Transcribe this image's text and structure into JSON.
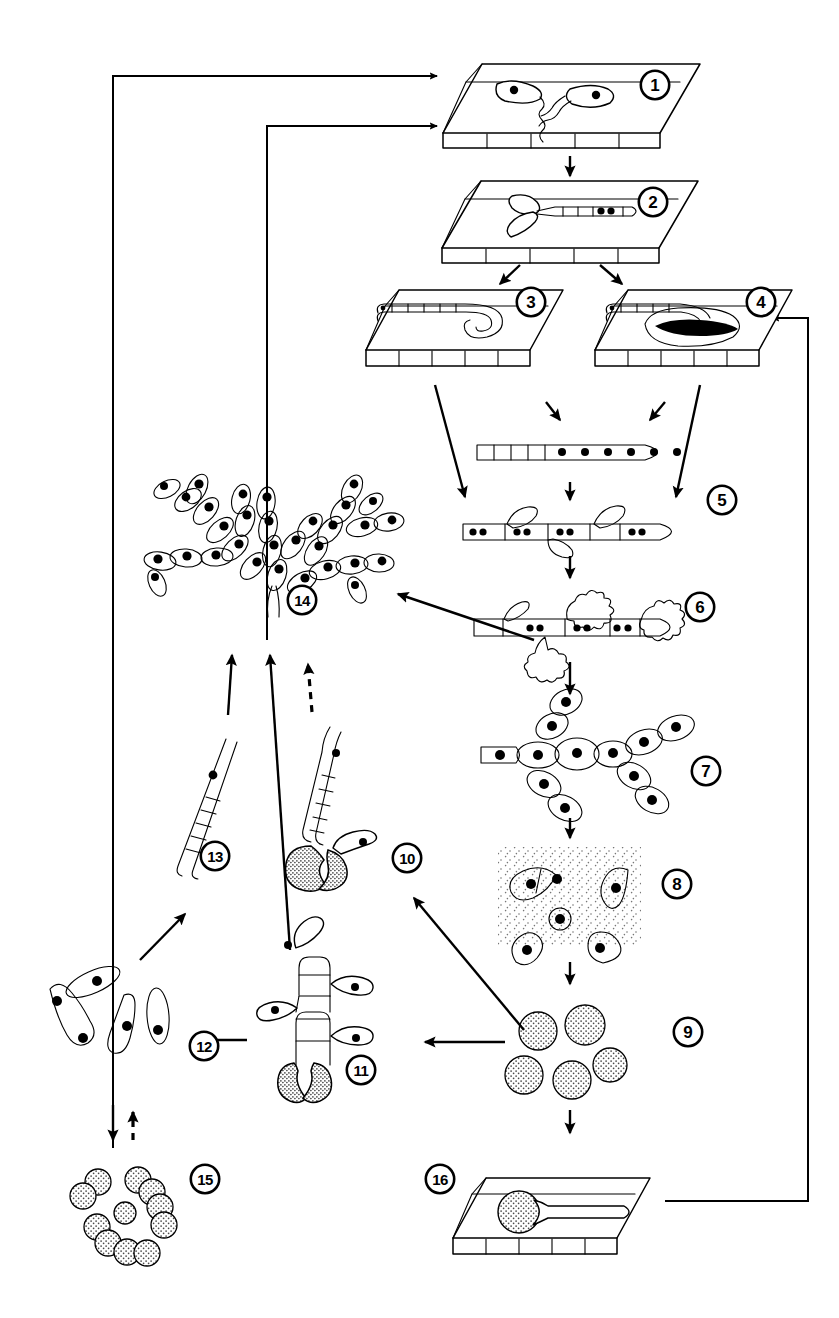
{
  "figure": {
    "background_color": "#ffffff",
    "line_color": "#000000",
    "nucleus_color": "#000000",
    "stipple_color": "#555555",
    "width": 839,
    "height": 1318
  },
  "stages": [
    {
      "id": 1,
      "label": "1",
      "name": "spores-germinating-on-leaf",
      "caption": "Two elongate spores with germ tubes on the host leaf surface",
      "number_x": 655,
      "number_y": 85
    },
    {
      "id": 2,
      "label": "2",
      "name": "appressorium-on-leaf",
      "caption": "Germ tube forming a forked appressorium on the leaf surface, two nuclei in the spore",
      "number_x": 653,
      "number_y": 202
    },
    {
      "id": 3,
      "label": "3",
      "name": "monokaryotic-penetration-hypha",
      "caption": "Penetration hypha growing inside the host tissue, no lesion",
      "number_x": 531,
      "number_y": 302
    },
    {
      "id": 4,
      "label": "4",
      "name": "penetration-hypha-with-lesion",
      "caption": "Penetration hypha inside host tissue with a dark necrotic lesion",
      "number_x": 761,
      "number_y": 302
    },
    {
      "id": 5,
      "label": "5",
      "name": "multinucleate-hypha",
      "caption": "Septate, multinucleate hypha and dikaryotic hypha with lateral branches",
      "number_x": 722,
      "number_y": 500
    },
    {
      "id": 6,
      "label": "6",
      "name": "haustoria-forming-hypha",
      "caption": "Dikaryotic hypha bearing lobed haustoria",
      "number_x": 700,
      "number_y": 607
    },
    {
      "id": 7,
      "label": "7",
      "name": "sporogenous-cell-chains",
      "caption": "Branched chains of swollen sporogenous cells, each uninucleate",
      "number_x": 706,
      "number_y": 771
    },
    {
      "id": 8,
      "label": "8",
      "name": "crescent-conidia-in-matrix",
      "caption": "Crescent-shaped conidia released into a mucilaginous matrix",
      "number_x": 677,
      "number_y": 884
    },
    {
      "id": 9,
      "label": "9",
      "name": "round-resting-spores",
      "caption": "Five thick-walled round resting spores (teliospores)",
      "number_x": 688,
      "number_y": 1032
    },
    {
      "id": 10,
      "label": "10",
      "name": "germinating-spore-with-sporidium",
      "caption": "Resting spore germinating into a septate promycelium bearing one sporidium",
      "number_x": 407,
      "number_y": 858
    },
    {
      "id": 11,
      "label": "11",
      "name": "basidium-with-four-sporidia",
      "caption": "Four-celled basidium (promycelium) bearing four lateral sporidia",
      "number_x": 361,
      "number_y": 1070
    },
    {
      "id": 12,
      "label": "12",
      "name": "free-sporidia",
      "caption": "Free spindle-shaped uninucleate sporidia (basidiospores)",
      "number_x": 204,
      "number_y": 1046
    },
    {
      "id": 13,
      "label": "13",
      "name": "septate-germ-tube",
      "caption": "Sporidium germinating into a long septate germ tube",
      "number_x": 215,
      "number_y": 856
    },
    {
      "id": 14,
      "label": "14",
      "name": "branched-budding-cell-chains",
      "caption": "Branched tree-like colony of budding yeast-like cells in chains",
      "number_x": 302,
      "number_y": 600
    },
    {
      "id": 15,
      "label": "15",
      "name": "round-budding-spore-clusters",
      "caption": "Clusters of small round stippled budding spores",
      "number_x": 205,
      "number_y": 1179
    },
    {
      "id": 16,
      "label": "16",
      "name": "resting-spore-germinating-on-leaf",
      "caption": "Resting spore germinating on the leaf surface producing a germ tube",
      "number_x": 440,
      "number_y": 1179
    }
  ],
  "connections": [
    {
      "name": "arrow-1-to-2",
      "from": 1,
      "to": 2,
      "style": "solid",
      "direction": "down"
    },
    {
      "name": "arrow-2-to-3",
      "from": 2,
      "to": 3,
      "style": "solid",
      "direction": "down-left"
    },
    {
      "name": "arrow-2-to-4",
      "from": 2,
      "to": 4,
      "style": "solid",
      "direction": "down-right"
    },
    {
      "name": "arrow-3-to-5hypha",
      "from": 3,
      "to": 5,
      "style": "solid",
      "direction": "down-right"
    },
    {
      "name": "arrow-4-to-5hypha",
      "from": 4,
      "to": 5,
      "style": "solid",
      "direction": "down-left"
    },
    {
      "name": "arrow-5a-to-5b",
      "from": 5,
      "to": 5,
      "style": "solid",
      "direction": "down"
    },
    {
      "name": "arrow-5-to-6",
      "from": 5,
      "to": 6,
      "style": "solid",
      "direction": "down"
    },
    {
      "name": "arrow-6-to-7",
      "from": 6,
      "to": 7,
      "style": "solid",
      "direction": "down"
    },
    {
      "name": "arrow-7-to-8",
      "from": 7,
      "to": 8,
      "style": "solid",
      "direction": "down"
    },
    {
      "name": "arrow-8-to-9",
      "from": 8,
      "to": 9,
      "style": "solid",
      "direction": "down"
    },
    {
      "name": "arrow-9-to-16",
      "from": 9,
      "to": 16,
      "style": "solid",
      "direction": "down"
    },
    {
      "name": "arrow-6-to-14",
      "from": 6,
      "to": 14,
      "style": "solid",
      "direction": "up-left"
    },
    {
      "name": "arrow-9-to-10",
      "from": 9,
      "to": 10,
      "style": "solid",
      "direction": "up-left"
    },
    {
      "name": "arrow-9-to-11",
      "from": 9,
      "to": 11,
      "style": "solid",
      "direction": "left"
    },
    {
      "name": "arrow-11-to-12",
      "from": 11,
      "to": 12,
      "style": "solid",
      "direction": "left"
    },
    {
      "name": "arrow-12-to-13",
      "from": 12,
      "to": 13,
      "style": "solid",
      "direction": "up-right"
    },
    {
      "name": "arrow-13-to-14",
      "from": 13,
      "to": 14,
      "style": "solid",
      "direction": "up"
    },
    {
      "name": "arrow-11-to-14",
      "from": 11,
      "to": 14,
      "style": "solid",
      "direction": "up"
    },
    {
      "name": "arrow-10-to-14-dashed",
      "from": 10,
      "to": 14,
      "style": "dashed",
      "direction": "up"
    },
    {
      "name": "arrow-12-to-15",
      "from": 12,
      "to": 15,
      "style": "solid",
      "direction": "down"
    },
    {
      "name": "arrow-15-to-12-dashed",
      "from": 15,
      "to": 12,
      "style": "dashed",
      "direction": "up"
    },
    {
      "name": "feedback-arrow-15-to-1",
      "from": 15,
      "to": 1,
      "style": "solid",
      "direction": "right-angle-up-right"
    },
    {
      "name": "feedback-arrow-14-to-1",
      "from": 14,
      "to": 1,
      "style": "solid",
      "direction": "right-angle-up-right"
    },
    {
      "name": "feedback-arrow-16-to-4",
      "from": 16,
      "to": 4,
      "style": "solid",
      "direction": "right-angle-up-left"
    }
  ]
}
